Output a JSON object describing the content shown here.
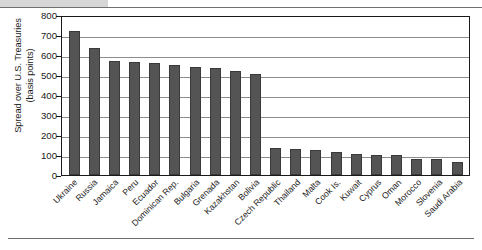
{
  "figure": {
    "y_axis_title": "Spread over U.S. Treasuries\n(basis points)",
    "bar_color": "#545454",
    "gridline_color": "#8c8c8c",
    "axis_color": "#1a1a1a"
  },
  "chart_data": {
    "type": "bar",
    "title": "",
    "xlabel": "",
    "ylabel": "Spread over U.S. Treasuries (basis points)",
    "ylim": [
      0,
      800
    ],
    "yticks": [
      0,
      100,
      200,
      300,
      400,
      500,
      600,
      700,
      800
    ],
    "ytick_labels": [
      "0",
      "100",
      "200",
      "300",
      "400",
      "500",
      "600",
      "700",
      "800"
    ],
    "grid": true,
    "legend": "none",
    "categories": [
      "Ukraine",
      "Russia",
      "Jamaica",
      "Peru",
      "Ecuador",
      "Dominican Rep.",
      "Bulgaria",
      "Grenada",
      "Kazakhstan",
      "Bolivia",
      "Czech Republic",
      "Thailand",
      "Malta",
      "Cook Is.",
      "Kuwait",
      "Cyprus",
      "Oman",
      "Morocco",
      "Slovenia",
      "Saudi Arabia"
    ],
    "values": [
      720,
      635,
      572,
      565,
      558,
      548,
      542,
      533,
      520,
      506,
      135,
      128,
      125,
      117,
      103,
      102,
      100,
      78,
      78,
      65
    ]
  }
}
